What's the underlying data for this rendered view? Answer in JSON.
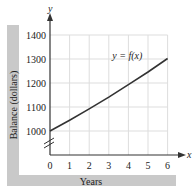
{
  "header_partial": "y(x) = f(x), y = f(x) ...",
  "chart_data": {
    "type": "line",
    "title": "",
    "xlabel": "Years",
    "ylabel": "Balance (dollars)",
    "x_axis_symbol": "x",
    "y_axis_symbol": "y",
    "xlim": [
      0,
      6
    ],
    "ylim": [
      1000,
      1400
    ],
    "y_axis_break": true,
    "grid": true,
    "x_ticks": [
      "0",
      "1",
      "2",
      "3",
      "4",
      "5",
      "6"
    ],
    "y_ticks": [
      "1000",
      "1100",
      "1200",
      "1300",
      "1400"
    ],
    "series": [
      {
        "name": "y = f(x)",
        "x": [
          0,
          1,
          2,
          3,
          4,
          5,
          6
        ],
        "values": [
          1000,
          1045,
          1092,
          1141,
          1193,
          1246,
          1302
        ]
      }
    ],
    "annotations": [
      {
        "text": "y = f(x)",
        "x": 4.2,
        "y": 1265
      }
    ]
  },
  "colors": {
    "band": "#c9c9c9",
    "grid": "#dddddd",
    "axis": "#333333",
    "curve": "#333333"
  }
}
